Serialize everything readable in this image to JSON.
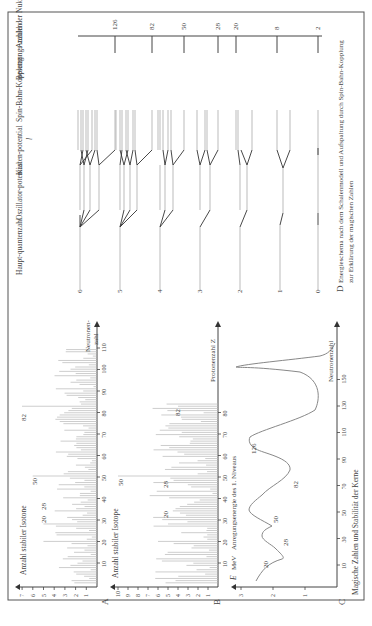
{
  "figure": {
    "orientation": "rotated-90-ccw",
    "panel_A": {
      "letter": "A",
      "ylabel": "Anzahl stabiler Isotone",
      "xlabel": "Neutronenzahl",
      "y_ticks": [
        "1",
        "2",
        "3",
        "4",
        "5",
        "6",
        "7"
      ],
      "x_ticks": [
        "10",
        "20",
        "30",
        "40",
        "50",
        "60",
        "70",
        "80",
        "90",
        "100",
        "110"
      ],
      "annotations": [
        "20",
        "28",
        "50",
        "82"
      ]
    },
    "panel_B": {
      "letter": "B",
      "ylabel": "Anzahl stabiler Isotope",
      "xlabel": "Protonenzahl Z",
      "y_ticks": [
        "1",
        "2",
        "3",
        "4",
        "5",
        "6",
        "7",
        "8",
        "9",
        "10"
      ],
      "x_ticks": [
        "10",
        "20",
        "30",
        "40",
        "50",
        "60",
        "70",
        "80"
      ],
      "annotations": [
        "20",
        "28",
        "50",
        "82"
      ]
    },
    "panel_C": {
      "letter": "C",
      "ylabel_symbol": "E",
      "ylabel_unit": "MeV",
      "ylabel": "Anregungsenergie des 1. Niveaus",
      "xlabel": "Neutronenzahl",
      "y_ticks": [
        "1",
        "2",
        "3"
      ],
      "x_ticks": [
        "10",
        "30",
        "50",
        "70",
        "90",
        "110",
        "130",
        "150"
      ],
      "annotations": [
        "20",
        "28",
        "50",
        "82",
        "126"
      ],
      "caption": "Magische Zahlen und Stabilität der Kerne"
    },
    "panel_D": {
      "letter": "D",
      "caption_line1": "Energieschema nach dem Schalenmodell und Aufspaltung durch Spin-Bahn-Kopplung",
      "caption_line2": "zur Erklärung der magischen Zahlen",
      "columns": {
        "haupt": "Haupt-quantenzahl",
        "osz": "Oszillator-potential",
        "kasten": "Kasten-potential",
        "l": "l",
        "spin": "Spin-Bahn-Kopplung",
        "besetzung": "Besetzungs-zahlen",
        "anzahl": "Anzahl der Nukleonen im Kern insgesamt"
      },
      "haupt_labels": [
        "6",
        "5",
        "4",
        "3",
        "2",
        "1",
        "0"
      ],
      "magic_numbers": [
        "126",
        "82",
        "50",
        "28",
        "20",
        "8",
        "2"
      ]
    }
  },
  "chart_data": [
    {
      "type": "bar",
      "title": "A: Anzahl stabiler Isotone",
      "xlabel": "Neutronenzahl",
      "ylabel": "Anzahl stabiler Isotone",
      "ylim": [
        0,
        7
      ],
      "xlim": [
        0,
        120
      ],
      "peaks": {
        "20": 5,
        "28": 5,
        "50": 6,
        "82": 7
      },
      "typical_value_range": [
        1,
        4
      ]
    },
    {
      "type": "bar",
      "title": "B: Anzahl stabiler Isotope",
      "xlabel": "Protonenzahl Z",
      "ylabel": "Anzahl stabiler Isotope",
      "ylim": [
        0,
        10
      ],
      "xlim": [
        0,
        120
      ],
      "peaks": {
        "20": 6,
        "28": 5,
        "50": 10,
        "82": 4
      },
      "typical_value_range": [
        1,
        7
      ]
    },
    {
      "type": "line",
      "title": "C: Anregungsenergie des 1. Niveaus",
      "xlabel": "Neutronenzahl",
      "ylabel": "E MeV",
      "ylim": [
        0,
        3
      ],
      "xlim": [
        0,
        160
      ],
      "x": [
        2,
        12,
        20,
        24,
        28,
        38,
        50,
        66,
        82,
        100,
        124,
        126,
        128,
        140,
        150
      ],
      "values": [
        2.9,
        1.6,
        2.2,
        1.4,
        1.5,
        1.2,
        2.0,
        0.8,
        1.8,
        0.6,
        2.5,
        2.7,
        2.5,
        0.6,
        0.2
      ]
    }
  ]
}
